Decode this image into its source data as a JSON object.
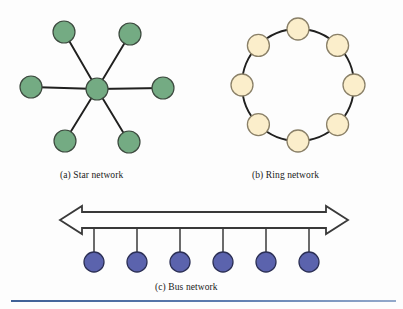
{
  "figure": {
    "background_color": "#fdfdfd",
    "width": 403,
    "height": 309
  },
  "captions": {
    "a": "(a) Star network",
    "b": "(b) Ring network",
    "c": "(c) Bus network"
  },
  "rule": {
    "color": "#4a6a9e"
  },
  "chart_data": {
    "type": "diagram",
    "panels": [
      {
        "id": "star",
        "label": "(a) Star network",
        "topology": "star",
        "node_fill": "#74ab83",
        "node_stroke": "#3d4a3f",
        "edge_color": "#20201f",
        "node_radius": 11,
        "center_node": {
          "x": 97,
          "y": 89
        },
        "leaf_nodes": [
          {
            "x": 64,
            "y": 32
          },
          {
            "x": 130,
            "y": 34
          },
          {
            "x": 31,
            "y": 87
          },
          {
            "x": 163,
            "y": 88
          },
          {
            "x": 65,
            "y": 141
          },
          {
            "x": 129,
            "y": 142
          }
        ],
        "node_count": 7,
        "edge_count": 6
      },
      {
        "id": "ring",
        "label": "(b) Ring network",
        "topology": "ring",
        "node_fill": "#fbeecb",
        "node_stroke": "#8a8068",
        "edge_color": "#20201f",
        "node_radius": 11,
        "ring_center": {
          "x": 298,
          "y": 85
        },
        "ring_radius": 56,
        "node_count": 8,
        "node_angles_deg": [
          270,
          315,
          0,
          45,
          90,
          135,
          180,
          225
        ]
      },
      {
        "id": "bus",
        "label": "(c) Bus network",
        "topology": "bus",
        "node_fill": "#5b63ad",
        "node_stroke": "#2b2f55",
        "edge_color": "#3a3a3a",
        "node_radius": 10,
        "bus_bar": {
          "left_x": 60,
          "right_x": 348,
          "top_y": 212,
          "bottom_y": 228,
          "arrowheads": "both",
          "style": "outline"
        },
        "stub_length": 36,
        "node_count": 6,
        "nodes": [
          {
            "x": 94,
            "y": 262
          },
          {
            "x": 137,
            "y": 262
          },
          {
            "x": 180,
            "y": 262
          },
          {
            "x": 223,
            "y": 262
          },
          {
            "x": 266,
            "y": 262
          },
          {
            "x": 309,
            "y": 262
          }
        ]
      }
    ]
  }
}
